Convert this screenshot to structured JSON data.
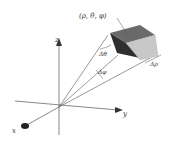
{
  "diagram": {
    "point_label": "(ρ, θ, φ)",
    "delta_theta_label": "Δθ",
    "delta_phi_label": "Δφ",
    "delta_rho_label": "Δρ",
    "axes": {
      "x": "x",
      "y": "y",
      "z": "z"
    },
    "colors": {
      "line": "#555555",
      "front_face": "#2f2f2f",
      "top_face": "#6a6a6a",
      "side_face": "#c8c8c8",
      "background": "#ffffff"
    }
  }
}
